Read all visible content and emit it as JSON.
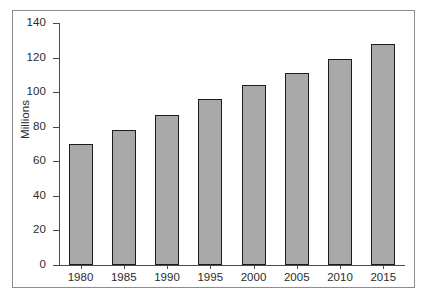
{
  "chart_data": {
    "type": "bar",
    "title": "",
    "subtitle": "",
    "xlabel": "",
    "ylabel": "Millions",
    "categories": [
      "1980",
      "1985",
      "1990",
      "1995",
      "2000",
      "2005",
      "2010",
      "2015"
    ],
    "values": [
      70,
      78,
      87,
      96,
      104,
      111,
      119,
      128
    ],
    "series": [
      {
        "name": "Millions",
        "values": [
          70,
          78,
          87,
          96,
          104,
          111,
          119,
          128
        ]
      }
    ],
    "ylim": [
      0,
      140
    ],
    "yticks": [
      0,
      20,
      40,
      60,
      80,
      100,
      120,
      140
    ],
    "ytick_labels": [
      "0",
      "20",
      "40",
      "60",
      "80",
      "100",
      "120",
      "140"
    ],
    "xtick_labels": [
      "1980",
      "1985",
      "1990",
      "1995",
      "2000",
      "2005",
      "2010",
      "2015"
    ],
    "grid": false,
    "legend": false,
    "legend_position": "none",
    "bar_color": "#a9a9a9",
    "bar_border_color": "#1c1c1c",
    "axis_color": "#4a4a4a",
    "frame_color": "#8d8d8d",
    "background_color": "#ffffff"
  }
}
